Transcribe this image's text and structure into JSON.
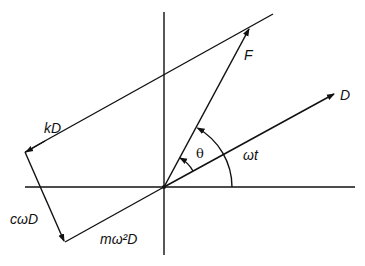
{
  "diagram": {
    "labels": {
      "F": "F",
      "D": "D",
      "kD": "kD",
      "cwD": "cωD",
      "mw2D": "mω²D",
      "theta": "θ",
      "wt": "ωt"
    },
    "colors": {
      "stroke": "#111111",
      "background": "#ffffff"
    }
  }
}
